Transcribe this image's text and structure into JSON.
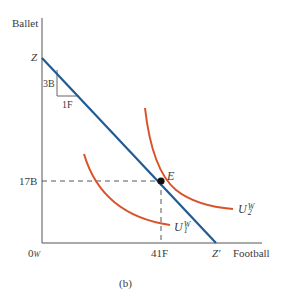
{
  "diagram": {
    "caption": "(b)",
    "axes": {
      "y_label": "Ballet",
      "x_label": "Football",
      "origin_label": "0",
      "origin_subscript": "W"
    },
    "budget_line": {
      "start_label": "Z",
      "end_label": "Z′",
      "color": "#1f5b94"
    },
    "slope_triangle": {
      "rise_label": "3B",
      "run_label": "1F"
    },
    "equilibrium": {
      "point_label": "E",
      "ballet_value": "17B",
      "football_value": "41F"
    },
    "indifference_curves": [
      {
        "name": "U",
        "superscript": "W",
        "subscript": "1",
        "color": "#d9532a"
      },
      {
        "name": "U",
        "superscript": "W",
        "subscript": "2",
        "color": "#d9532a"
      }
    ]
  }
}
